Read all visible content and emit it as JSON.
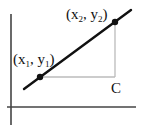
{
  "diagram": {
    "type": "slope-triangle",
    "colors": {
      "axis": "#444444",
      "line": "#111111",
      "triangle": "#bbbbbb",
      "point": "#111111",
      "text": "#111111"
    },
    "axes": {
      "x_axis": {
        "x1": 7,
        "y1": 107,
        "x2": 136,
        "y2": 107
      },
      "y_axis": {
        "x1": 11,
        "y1": 14,
        "x2": 11,
        "y2": 125
      }
    },
    "line": {
      "x1": 24,
      "y1": 89,
      "x2": 131,
      "y2": 10
    },
    "points": [
      {
        "id": "p1",
        "cx": 40,
        "cy": 77,
        "label": "(x",
        "sub1": "1",
        "mid": ", y",
        "sub2": "1",
        "end": ")",
        "lx": 13,
        "ly": 64
      },
      {
        "id": "p2",
        "cx": 115,
        "cy": 22,
        "label": "(x",
        "sub1": "2",
        "mid": ", y",
        "sub2": "2",
        "end": ")",
        "lx": 66,
        "ly": 19
      }
    ],
    "triangle": {
      "corner_x": 115,
      "corner_y": 77
    },
    "corner_label": {
      "text": "C",
      "x": 111,
      "y": 93
    }
  }
}
